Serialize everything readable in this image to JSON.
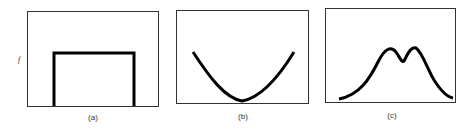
{
  "figure": {
    "y_label": "f",
    "panels": [
      {
        "id": "a",
        "caption": "(a)",
        "shape": "rectangular pulse (uniform/flat top)"
      },
      {
        "id": "b",
        "caption": "(b)",
        "shape": "U-shaped parabola"
      },
      {
        "id": "c",
        "caption": "(c)",
        "shape": "bimodal curve with two close peaks"
      }
    ]
  },
  "colors": {
    "frame": "#333333",
    "curve": "#000000",
    "background": "#ffffff"
  }
}
